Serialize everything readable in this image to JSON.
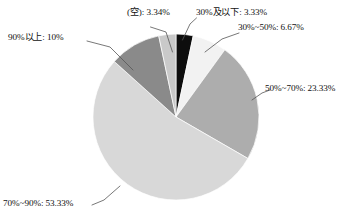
{
  "chart_data": {
    "type": "pie",
    "title": "",
    "subtitle": "",
    "xlabel": "",
    "ylabel": "",
    "legend_position": "none",
    "grid": false,
    "labels_show_percent": true,
    "total_percent": "100%",
    "categories": [
      "30%及以下",
      "30%~50%",
      "50%~70%",
      "70%~90%",
      "90%以上",
      "(空)"
    ],
    "values": [
      3.33,
      6.67,
      23.33,
      53.33,
      10,
      3.34
    ],
    "colors": [
      "#0d0d0d",
      "#f2f2f2",
      "#adadad",
      "#d8d8d8",
      "#8a8a8a",
      "#c9c9c9"
    ],
    "slices": [
      {
        "name": "le-30",
        "category": "30%及以下",
        "value": 3.33,
        "value_text": "3.33%",
        "label": "30%及以下: 3.33%",
        "color": "#0d0d0d"
      },
      {
        "name": "30-to-50",
        "category": "30%~50%",
        "value": 6.67,
        "value_text": "6.67%",
        "label": "30%~50%: 6.67%",
        "color": "#f2f2f2"
      },
      {
        "name": "50-to-70",
        "category": "50%~70%",
        "value": 23.33,
        "value_text": "23.33%",
        "label": "50%~70%: 23.33%",
        "color": "#adadad"
      },
      {
        "name": "70-to-90",
        "category": "70%~90%",
        "value": 53.33,
        "value_text": "53.33%",
        "label": "70%~90%: 53.33%",
        "color": "#d8d8d8"
      },
      {
        "name": "ge-90",
        "category": "90%以上",
        "value": 10,
        "value_text": "10%",
        "label": "90%以上: 10%",
        "color": "#8a8a8a"
      },
      {
        "name": "empty",
        "category": "(空)",
        "value": 3.34,
        "value_text": "3.34%",
        "label": "(空): 3.34%",
        "color": "#c9c9c9"
      }
    ],
    "geometry": {
      "center_x": 176,
      "center_y": 117,
      "radius": 83,
      "start_angle_deg": 0,
      "direction": "clockwise"
    },
    "leader_line_color": "#555555"
  }
}
